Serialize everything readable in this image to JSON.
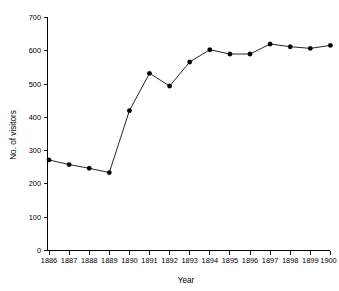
{
  "chart_data": {
    "type": "line",
    "title": "",
    "xlabel": "Year",
    "ylabel": "No. of visitors",
    "categories": [
      "1886",
      "1887",
      "1888",
      "1889",
      "1890",
      "1891",
      "1892",
      "1893",
      "1894",
      "1895",
      "1896",
      "1897",
      "1898",
      "1899",
      "1900"
    ],
    "x": [
      1886,
      1887,
      1888,
      1889,
      1890,
      1891,
      1892,
      1893,
      1894,
      1895,
      1896,
      1897,
      1898,
      1899,
      1900
    ],
    "values": [
      272,
      258,
      247,
      234,
      420,
      532,
      494,
      566,
      603,
      590,
      590,
      620,
      612,
      607,
      616
    ],
    "series": [
      {
        "name": "No. of visitors",
        "values": [
          272,
          258,
          247,
          234,
          420,
          532,
          494,
          566,
          603,
          590,
          590,
          620,
          612,
          607,
          616
        ]
      }
    ],
    "xlim": [
      1886,
      1900
    ],
    "ylim": [
      0,
      700
    ],
    "ytick_labels": [
      "0",
      "100",
      "200",
      "300",
      "400",
      "500",
      "600",
      "700"
    ],
    "ytick_values": [
      0,
      100,
      200,
      300,
      400,
      500,
      600,
      700
    ],
    "xtick_labels": [
      "1886",
      "1887",
      "1888",
      "1889",
      "1890",
      "1891",
      "1892",
      "1893",
      "1894",
      "1895",
      "1896",
      "1897",
      "1898",
      "1899",
      "1900"
    ],
    "grid": false,
    "legend": false,
    "legend_position": "none",
    "marker": "filled-circle",
    "line_color": "#000000",
    "marker_color": "#000000",
    "background_color": "#ffffff"
  }
}
